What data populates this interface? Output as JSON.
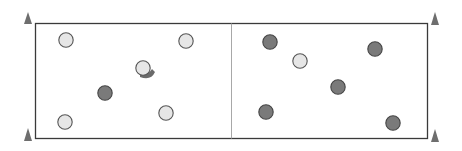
{
  "diagram": {
    "type": "drill-field",
    "colors": {
      "field_border": "#3a3a3a",
      "center_line": "#a8a8a8",
      "cone": "#6e6e6e",
      "light_player_fill": "#e6e6e6",
      "light_player_stroke": "#555555",
      "dark_player_fill": "#7a7a7a",
      "dark_player_stroke": "#444444",
      "marker_fill": "#6a6a6a"
    },
    "cones": [
      {
        "corner": "top-left"
      },
      {
        "corner": "bottom-left"
      },
      {
        "corner": "top-right"
      },
      {
        "corner": "bottom-right"
      }
    ],
    "halves": [
      {
        "side": "left",
        "light_players": 5,
        "dark_players": 1,
        "has_marker_shape": true
      },
      {
        "side": "right",
        "light_players": 1,
        "dark_players": 5
      }
    ],
    "players": [
      {
        "team": "light",
        "half": "left"
      },
      {
        "team": "light",
        "half": "left"
      },
      {
        "team": "light",
        "half": "left",
        "with_marker": true
      },
      {
        "team": "dark",
        "half": "left"
      },
      {
        "team": "light",
        "half": "left"
      },
      {
        "team": "light",
        "half": "left"
      },
      {
        "team": "dark",
        "half": "right"
      },
      {
        "team": "light",
        "half": "right"
      },
      {
        "team": "dark",
        "half": "right"
      },
      {
        "team": "dark",
        "half": "right"
      },
      {
        "team": "dark",
        "half": "right"
      },
      {
        "team": "dark",
        "half": "right"
      }
    ]
  }
}
